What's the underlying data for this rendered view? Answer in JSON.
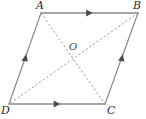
{
  "figure": {
    "kind": "geometry-diagram",
    "shape": "parallelogram",
    "background_color": "#ffffff",
    "stroke_color": "#8a8a8a",
    "dash_color": "#9a9a9a",
    "label_color": "#2b2b2b",
    "vertices": [
      {
        "id": "A",
        "label": "A",
        "x": 41,
        "y": 13,
        "label_x": 36,
        "label_y": 0
      },
      {
        "id": "B",
        "label": "B",
        "x": 138,
        "y": 13,
        "label_x": 133,
        "label_y": 0
      },
      {
        "id": "C",
        "label": "C",
        "x": 105,
        "y": 104,
        "label_x": 107,
        "label_y": 106
      },
      {
        "id": "D",
        "label": "D",
        "x": 9,
        "y": 104,
        "label_x": 1,
        "label_y": 106
      }
    ],
    "center": {
      "id": "O",
      "label": "O",
      "x": 73,
      "y": 58,
      "label_x": 69,
      "label_y": 43
    },
    "sides": [
      {
        "id": "AB",
        "from": "A",
        "to": "B",
        "style": "solid",
        "tick": "single-arrow"
      },
      {
        "id": "DC",
        "from": "D",
        "to": "C",
        "style": "solid",
        "tick": "single-arrow"
      },
      {
        "id": "DA",
        "from": "D",
        "to": "A",
        "style": "solid",
        "tick": "single-arrow"
      },
      {
        "id": "CB",
        "from": "C",
        "to": "B",
        "style": "solid",
        "tick": "single-arrow"
      }
    ],
    "diagonals": [
      {
        "id": "AC",
        "from": "A",
        "to": "C",
        "style": "dashed"
      },
      {
        "id": "BD",
        "from": "B",
        "to": "D",
        "style": "dashed"
      }
    ]
  }
}
